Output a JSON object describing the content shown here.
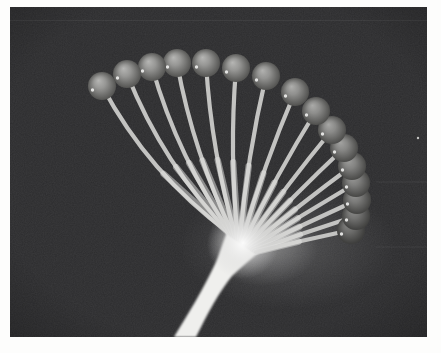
{
  "photo": {
    "frame": {
      "x": 10,
      "y": 7,
      "width": 417,
      "height": 330
    },
    "colors": {
      "page_bg": "#fdfdfc",
      "photo_bg": "#2c2c2e",
      "stalk": "#efefed",
      "stem": "#c3c3c1",
      "stem_bright": "#e6e6e4",
      "glow_core": "#ffffff",
      "glow_mid": "#dedede",
      "glow_outer": "#c9c9c9",
      "speck": "#e8e8e6"
    },
    "ball": {
      "radius": 14,
      "gradient": [
        {
          "offset": 0,
          "color": "#b6b6b4"
        },
        {
          "offset": 0.38,
          "color": "#979795"
        },
        {
          "offset": 0.72,
          "color": "#6e6e6c"
        },
        {
          "offset": 1,
          "color": "#4c4c4a"
        }
      ],
      "specular": {
        "dx": -9.5,
        "dy": 4,
        "r": 1.7,
        "color": "#f0f0ee",
        "opacity": 0.9
      }
    },
    "balls": [
      {
        "x": 102,
        "y": 86,
        "bow": 22,
        "shade": 0
      },
      {
        "x": 127,
        "y": 74,
        "bow": 19,
        "shade": 0
      },
      {
        "x": 152,
        "y": 67,
        "bow": 16,
        "shade": 0
      },
      {
        "x": 177,
        "y": 63,
        "bow": 13,
        "shade": 0
      },
      {
        "x": 206,
        "y": 63,
        "bow": 10,
        "shade": 0
      },
      {
        "x": 236,
        "y": 68,
        "bow": 8,
        "shade": 0
      },
      {
        "x": 266,
        "y": 76,
        "bow": 6,
        "shade": 0.02
      },
      {
        "x": 295,
        "y": 92,
        "bow": 5,
        "shade": 0.04
      },
      {
        "x": 316,
        "y": 111,
        "bow": 4,
        "shade": 0.06
      },
      {
        "x": 332,
        "y": 130,
        "bow": 3,
        "shade": 0.08
      },
      {
        "x": 344,
        "y": 148,
        "bow": 2.5,
        "shade": 0.1
      },
      {
        "x": 352,
        "y": 166,
        "bow": 2,
        "shade": 0.13
      },
      {
        "x": 356,
        "y": 183,
        "bow": 1.5,
        "shade": 0.16
      },
      {
        "x": 357,
        "y": 200,
        "bow": 1,
        "shade": 0.19
      },
      {
        "x": 356,
        "y": 216,
        "bow": 1,
        "shade": 0.23
      },
      {
        "x": 351,
        "y": 230,
        "bow": 1,
        "shade": 0.28
      }
    ],
    "stem": {
      "width": 4.2,
      "taper_width": 6.4,
      "taper_opacity": 0.5,
      "blur": 0.55
    },
    "base_segment": {
      "x1": 229,
      "y1": 233,
      "x2": 256,
      "y2": 252
    },
    "stalk_path": "M 174 337 C 188 314 203 290 216 262 C 219 255 222 245 227 232 L 258 253 C 249 261 240 268 232 276 C 219 292 208 313 196 337 Z",
    "stalk_blur": 1.2,
    "knot_glow": {
      "cx": 243,
      "cy": 243,
      "r": 36,
      "opacity": 0.9
    },
    "under_glow": [
      {
        "cx": 288,
        "cy": 246,
        "rx": 108,
        "ry": 64,
        "opacity": 0.2
      },
      {
        "cx": 262,
        "cy": 248,
        "rx": 56,
        "ry": 38,
        "opacity": 0.4
      }
    ],
    "scan_lines": [
      {
        "y": 20.5,
        "x1": 10,
        "x2": 427,
        "opacity": 0.055
      },
      {
        "y": 182,
        "x1": 376,
        "x2": 427,
        "opacity": 0.06
      },
      {
        "y": 247,
        "x1": 376,
        "x2": 427,
        "opacity": 0.05
      }
    ],
    "specks": [
      {
        "x": 418,
        "y": 138,
        "r": 1.2
      }
    ],
    "grain_opacity": 0.5,
    "vignette_opacity": 0.22
  }
}
